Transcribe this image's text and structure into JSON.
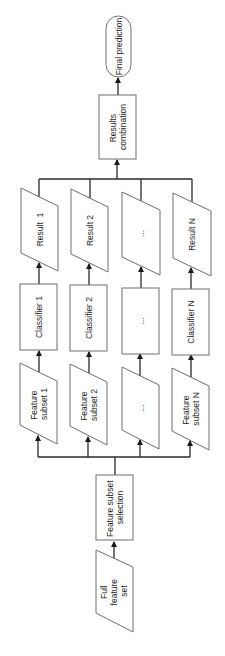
{
  "diagram": {
    "type": "flowchart",
    "orientation": "rotated-90-ccw",
    "colors": {
      "stroke": "#6e6e6e",
      "line": "#2a2a2a",
      "text": "#1e1e1e",
      "background": "#ffffff"
    },
    "input": {
      "label_line1": "Full",
      "label_line2": "feature",
      "label_line3": "set",
      "shape": "parallelogram"
    },
    "selection": {
      "label_line1": "Feature subset",
      "label_line2": "selection",
      "shape": "rectangle"
    },
    "branches": [
      {
        "subset_line1": "Feature",
        "subset_line2": "subset 1",
        "classifier": "Classifier 1",
        "result": "Result  1"
      },
      {
        "subset_line1": "Feature",
        "subset_line2": "subset 2",
        "classifier": "Classifier 2",
        "result": "Result 2"
      },
      {
        "subset_line1": "...",
        "subset_line2": "",
        "classifier": "...",
        "result": "..."
      },
      {
        "subset_line1": "Feature",
        "subset_line2": "subset N",
        "classifier": "Classifier N",
        "result": "Result N"
      }
    ],
    "combination": {
      "label_line1": "Results",
      "label_line2": "combination",
      "shape": "rectangle"
    },
    "output": {
      "label": "Final prediction",
      "shape": "rounded-terminal"
    }
  }
}
